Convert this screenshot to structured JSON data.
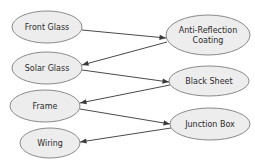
{
  "diagram": {
    "background_color": "#ffffff",
    "node_fill_color": "#ededed",
    "node_stroke_color": "#8a8a8a",
    "edge_color": "#4a4a4a",
    "label_color": "#2b2b2b",
    "nodes": [
      {
        "id": "front-glass",
        "label": "Front Glass",
        "lines": [
          "Front Glass"
        ],
        "cx": 47,
        "cy": 27,
        "rx": 35,
        "ry": 16,
        "column": "left"
      },
      {
        "id": "solar-glass",
        "label": "Solar Glass",
        "lines": [
          "Solar Glass"
        ],
        "cx": 47,
        "cy": 68,
        "rx": 35,
        "ry": 16,
        "column": "left"
      },
      {
        "id": "frame",
        "label": "Frame",
        "lines": [
          "Frame"
        ],
        "cx": 45,
        "cy": 106,
        "rx": 35,
        "ry": 16,
        "column": "left"
      },
      {
        "id": "wiring",
        "label": "Wiring",
        "lines": [
          "Wiring"
        ],
        "cx": 50,
        "cy": 143,
        "rx": 30,
        "ry": 15,
        "column": "left"
      },
      {
        "id": "anti-reflection-coating",
        "label": "Anti-Reflection Coating",
        "lines": [
          "Anti-Reflection",
          "Coating"
        ],
        "cx": 208,
        "cy": 35,
        "rx": 42,
        "ry": 20,
        "column": "right"
      },
      {
        "id": "black-sheet",
        "label": "Black Sheet",
        "lines": [
          "Black Sheet"
        ],
        "cx": 209,
        "cy": 81,
        "rx": 40,
        "ry": 15,
        "column": "right"
      },
      {
        "id": "junction-box",
        "label": "Junction Box",
        "lines": [
          "Junction Box"
        ],
        "cx": 210,
        "cy": 124,
        "rx": 40,
        "ry": 16,
        "column": "right"
      }
    ],
    "edges": [
      {
        "id": "edge-front-glass-to-coating",
        "from": "front-glass",
        "to": "anti-reflection-coating",
        "from_label": "Front Glass",
        "to_label": "Anti-Reflection Coating",
        "x1": 82,
        "y1": 30,
        "x2": 166,
        "y2": 38,
        "directed": true
      },
      {
        "id": "edge-coating-to-solar-glass",
        "from": "anti-reflection-coating",
        "to": "solar-glass",
        "from_label": "Anti-Reflection Coating",
        "to_label": "Solar Glass",
        "x1": 167,
        "y1": 42,
        "x2": 82,
        "y2": 65,
        "directed": true
      },
      {
        "id": "edge-solar-glass-to-black-sheet",
        "from": "solar-glass",
        "to": "black-sheet",
        "from_label": "Solar Glass",
        "to_label": "Black Sheet",
        "x1": 82,
        "y1": 70,
        "x2": 169,
        "y2": 82,
        "directed": true
      },
      {
        "id": "edge-black-sheet-to-frame",
        "from": "black-sheet",
        "to": "frame",
        "from_label": "Black Sheet",
        "to_label": "Frame",
        "x1": 170,
        "y1": 85,
        "x2": 80,
        "y2": 103,
        "directed": true
      },
      {
        "id": "edge-frame-to-junction-box",
        "from": "frame",
        "to": "junction-box",
        "from_label": "Frame",
        "to_label": "Junction Box",
        "x1": 80,
        "y1": 109,
        "x2": 170,
        "y2": 124,
        "directed": true
      },
      {
        "id": "edge-junction-box-to-wiring",
        "from": "junction-box",
        "to": "wiring",
        "from_label": "Junction Box",
        "to_label": "Wiring",
        "x1": 171,
        "y1": 128,
        "x2": 80,
        "y2": 142,
        "directed": true
      }
    ]
  }
}
